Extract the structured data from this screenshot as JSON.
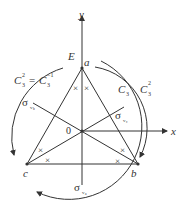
{
  "diagram": {
    "axes": {
      "x_label": "x",
      "y_label": "y",
      "origin_label": "0"
    },
    "vertices": {
      "a": "a",
      "b": "b",
      "c": "c"
    },
    "operations": {
      "identity": "E",
      "c3": "C",
      "c3_sub": "3",
      "c3sq_sup": "2",
      "c3sq_left_base": "C",
      "c3sq_left_sup": "2",
      "c3sq_left_sub": "3",
      "equals": "=",
      "c3inv_base": "C",
      "c3inv_sup": "−1",
      "c3inv_sub": "3"
    },
    "mirror_planes": {
      "sigma": "σ",
      "va_sub": "v",
      "va_subsub": "a",
      "vb_sub": "v",
      "vb_subsub": "b",
      "vc_sub": "v",
      "vc_subsub": "c"
    },
    "marker": "×",
    "color": "#333333"
  }
}
